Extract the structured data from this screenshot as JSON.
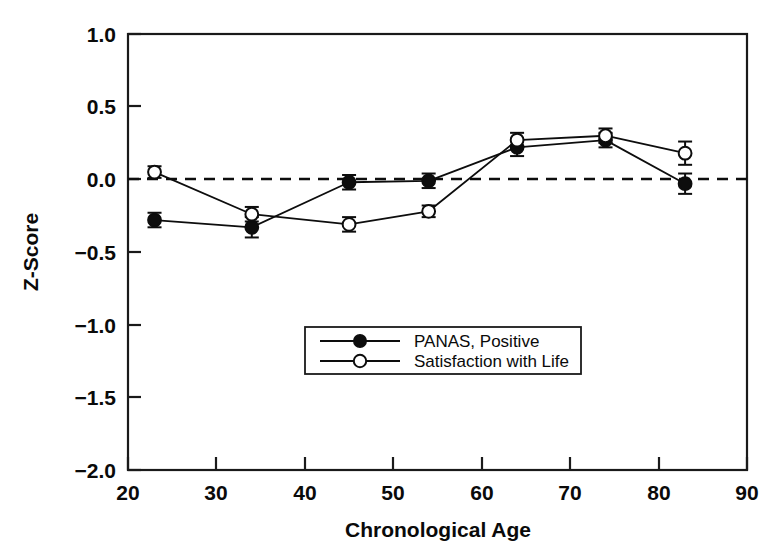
{
  "chart_data": {
    "type": "line",
    "title": "",
    "subtitle": "",
    "xlabel": "Chronological Age",
    "ylabel": "Z-Score",
    "xlim": [
      20,
      90
    ],
    "ylim": [
      -2.0,
      1.0
    ],
    "xticks": [
      20,
      30,
      40,
      50,
      60,
      70,
      80,
      90
    ],
    "xtick_labels": [
      "20",
      "30",
      "40",
      "50",
      "60",
      "70",
      "80",
      "90"
    ],
    "yticks": [
      1.0,
      0.5,
      0.0,
      -0.5,
      -1.0,
      -1.5,
      -2.0
    ],
    "ytick_labels": [
      "1.0",
      "0.5",
      "0.0",
      "−0.5",
      "−1.0",
      "−1.5",
      "−2.0"
    ],
    "grid": false,
    "legend_position": "center-bottom-inside",
    "reference_lines": [
      {
        "name": "zero-line",
        "axis": "y",
        "value": 0.0,
        "style": "dashed"
      }
    ],
    "x": [
      23,
      34,
      45,
      54,
      64,
      74,
      83
    ],
    "series": [
      {
        "name": "PANAS, Positive",
        "marker": "filled-circle",
        "values": [
          -0.28,
          -0.33,
          -0.02,
          -0.01,
          0.22,
          0.27,
          -0.03
        ],
        "errors": [
          0.05,
          0.07,
          0.05,
          0.05,
          0.06,
          0.05,
          0.07
        ]
      },
      {
        "name": "Satisfaction with Life",
        "marker": "open-circle",
        "values": [
          0.05,
          -0.24,
          -0.31,
          -0.22,
          0.27,
          0.3,
          0.18
        ],
        "errors": [
          0.04,
          0.05,
          0.05,
          0.04,
          0.05,
          0.05,
          0.08
        ]
      }
    ]
  },
  "legend": {
    "entries": [
      {
        "label": "PANAS, Positive",
        "marker": "filled-circle"
      },
      {
        "label": "Satisfaction with Life",
        "marker": "open-circle"
      }
    ]
  },
  "colors": {
    "ink": "#0d0d0d",
    "frame": "#1a1a1a",
    "background": "#ffffff",
    "marker_fill_open": "#ffffff"
  }
}
